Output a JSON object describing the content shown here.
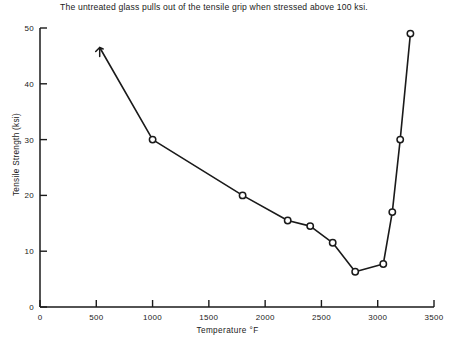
{
  "figure": {
    "note": "The untreated glass pulls out of the tensile grip when stressed above 100 ksi.",
    "ink_color": "#1a1a1a",
    "background_color": "#ffffff"
  },
  "chart_data": {
    "type": "line",
    "title": "The untreated glass pulls out of the tensile grip when stressed above 100 ksi.",
    "xlabel": "Temperature  °F",
    "ylabel": "Tensile Strength (ksi)",
    "xlim": [
      0,
      3500
    ],
    "ylim": [
      0,
      50
    ],
    "xticks": [
      0,
      500,
      1000,
      1500,
      2000,
      2500,
      3000,
      3500
    ],
    "xticklabels": [
      "0",
      "500",
      "1000",
      "1500",
      "2000",
      "2500",
      "3000",
      "3500"
    ],
    "yticks": [
      0,
      10,
      20,
      30,
      40,
      50
    ],
    "yticklabels": [
      "0",
      "10",
      "20",
      "30",
      "40",
      "50"
    ],
    "grid": false,
    "legend": null,
    "marker": "open-circle",
    "series": [
      {
        "name": "Tensile strength vs temperature",
        "x": [
          530,
          1000,
          1800,
          2200,
          2400,
          2600,
          2800,
          3050,
          3130,
          3200,
          3290
        ],
        "y": [
          46.5,
          30.0,
          20.0,
          15.5,
          14.5,
          11.5,
          6.3,
          7.7,
          17.0,
          30.0,
          49.0
        ],
        "markers": [
          "up-arrow",
          "circle",
          "circle",
          "circle",
          "circle",
          "circle",
          "circle",
          "circle",
          "circle",
          "circle",
          "circle"
        ]
      }
    ],
    "annotations": [
      {
        "text": "The untreated glass pulls out of the tensile grip when stressed above 100 ksi.",
        "target_point_index": 0,
        "note": "first datum drawn with an upward arrow head (value is a lower bound)"
      }
    ]
  }
}
